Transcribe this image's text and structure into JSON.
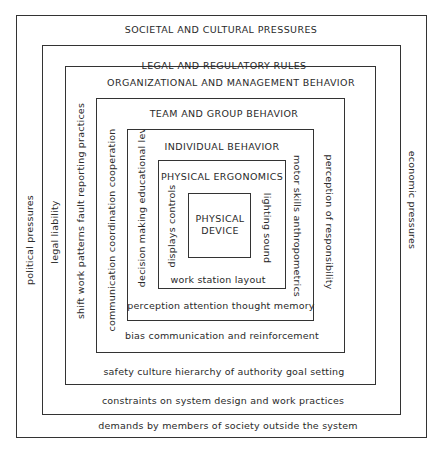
{
  "layers": [
    {
      "id": "societal",
      "title": "SOCIETAL AND CULTURAL PRESSURES",
      "left": "political pressures",
      "right": "economic pressures",
      "bottom": "demands by members of society outside the system"
    },
    {
      "id": "legal",
      "title": "LEGAL AND REGULATORY RULES",
      "left": "legal liability",
      "bottom": "constraints on system design and work practices"
    },
    {
      "id": "organizational",
      "title": "ORGANIZATIONAL AND MANAGEMENT BEHAVIOR",
      "left": "shift work patterns  fault reporting practices",
      "right": "perception of responsibility",
      "bottom": "safety culture  hierarchy of authority  goal setting"
    },
    {
      "id": "team",
      "title": "TEAM AND GROUP BEHAVIOR",
      "left": "communication  coordination  cooperation",
      "bottom": "bias communication and reinforcement"
    },
    {
      "id": "individual",
      "title": "INDIVIDUAL BEHAVIOR",
      "left": "decision making  educational level",
      "right": "motor skills  anthropometrics",
      "bottom": "perception  attention  thought  memory"
    },
    {
      "id": "ergonomics",
      "title": "PHYSICAL ERGONOMICS",
      "left": "displays  controls",
      "right": "lighting  sound",
      "bottom": "work station layout"
    },
    {
      "id": "device",
      "title_line1": "PHYSICAL",
      "title_line2": "DEVICE"
    }
  ]
}
